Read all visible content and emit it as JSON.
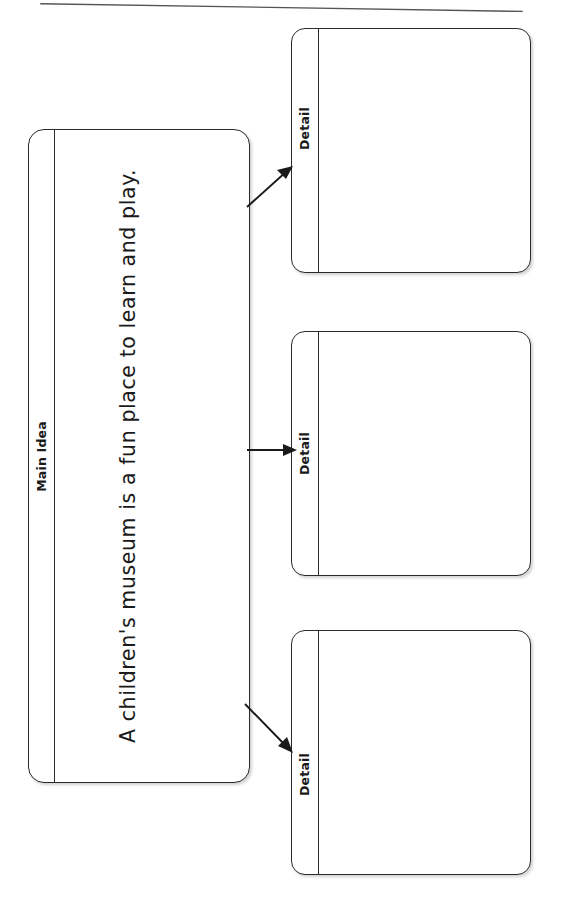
{
  "worksheet": {
    "type": "main-idea-and-details-graphic-organizer",
    "page_rule": "scan-page-edge-line",
    "main_idea": {
      "label": "Main Idea",
      "text": "A children's museum is a fun place to learn and play."
    },
    "details": [
      {
        "label": "Detail",
        "text": ""
      },
      {
        "label": "Detail",
        "text": ""
      },
      {
        "label": "Detail",
        "text": ""
      }
    ],
    "connectors": [
      {
        "name": "arrow-to-detail-1",
        "direction": "up-right"
      },
      {
        "name": "arrow-to-detail-2",
        "direction": "right"
      },
      {
        "name": "arrow-to-detail-3",
        "direction": "down-right"
      }
    ],
    "colors": {
      "ink": "#1a1a1a",
      "stroke": "#2b2b2b",
      "paper": "#ffffff"
    }
  }
}
